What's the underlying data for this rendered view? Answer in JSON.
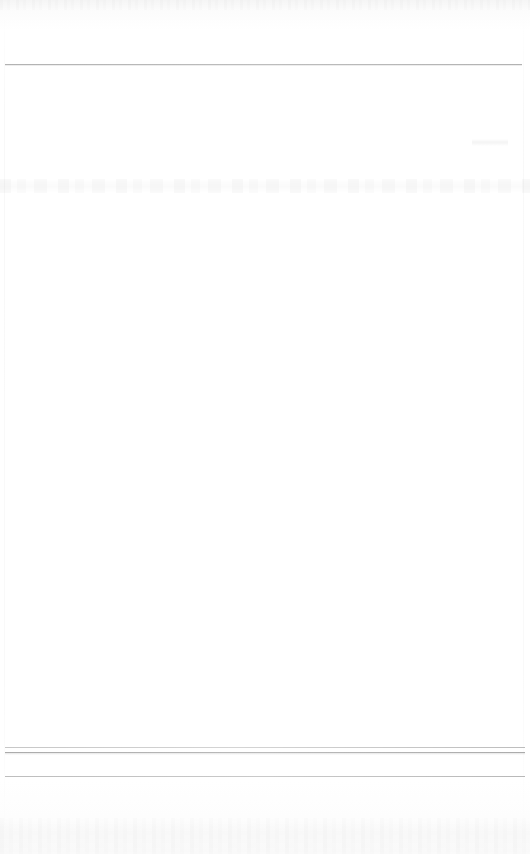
{
  "document": {
    "kind": "scanned-page",
    "condition": "faded",
    "legible_text": "",
    "page_background_color": "#ffffff",
    "ink_color": "#000000",
    "width_px": 530,
    "height_px": 854
  },
  "header": {
    "text": "",
    "note": ""
  },
  "rules": {
    "top": {
      "label": "",
      "y_px": 64,
      "x_start_px": 5,
      "x_end_px": 522
    },
    "footer_upper": {
      "label": "",
      "y_px": 747,
      "x_start_px": 5,
      "x_end_px": 525
    },
    "footer_middle": {
      "label": "",
      "y_px": 752,
      "x_start_px": 5,
      "x_end_px": 525
    },
    "footer_lower": {
      "label": "",
      "y_px": 776,
      "x_start_px": 5,
      "x_end_px": 525
    }
  },
  "faded_band": {
    "text": "",
    "y_px": 179,
    "legibility": "illegible"
  },
  "fragments": [
    {
      "id": "fragment-upper-right",
      "text": "",
      "x_px": 472,
      "y_px": 139,
      "legibility": "illegible"
    },
    {
      "id": "fragment-body-left",
      "text": "",
      "x_px": 116,
      "y_px": 237,
      "legibility": "illegible"
    }
  ],
  "body": {
    "text": ""
  },
  "footer": {
    "text": ""
  }
}
